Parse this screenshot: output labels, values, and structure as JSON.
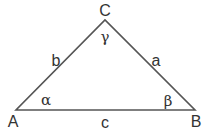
{
  "diagram": {
    "type": "triangle",
    "stroke_color": "#555555",
    "vertices": [
      {
        "name": "A",
        "x": 16,
        "y": 110
      },
      {
        "name": "B",
        "x": 195,
        "y": 110
      },
      {
        "name": "C",
        "x": 105,
        "y": 20
      }
    ],
    "vertex_labels": {
      "A": "A",
      "B": "B",
      "C": "C"
    },
    "side_labels": {
      "a": "a",
      "b": "b",
      "c": "c"
    },
    "angle_labels": {
      "alpha": "α",
      "beta": "β",
      "gamma": "γ"
    }
  }
}
